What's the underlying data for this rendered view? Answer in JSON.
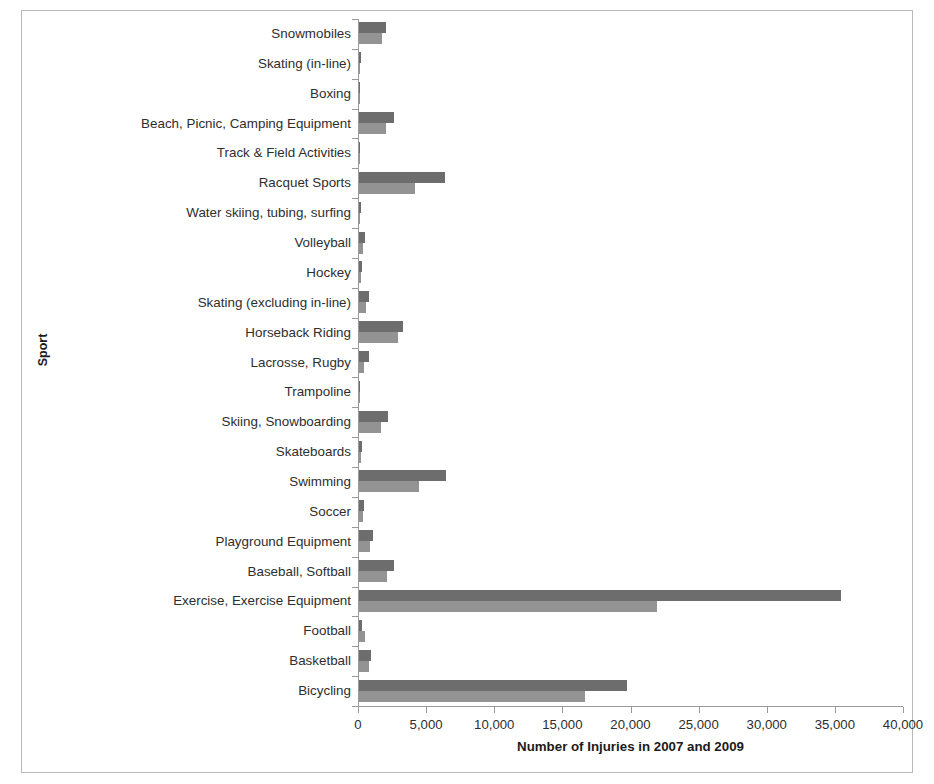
{
  "chart_data": {
    "type": "bar",
    "orientation": "horizontal",
    "title": "",
    "xlabel": "Number of Injuries in 2007 and 2009",
    "ylabel": "Sport",
    "xlim": [
      0,
      40000
    ],
    "xticks": [
      0,
      5000,
      10000,
      15000,
      20000,
      25000,
      30000,
      35000,
      40000
    ],
    "xtick_labels": [
      "0",
      "5,000",
      "10,000",
      "15,000",
      "20,000",
      "25,000",
      "30,000",
      "35,000",
      "40,000"
    ],
    "grid": false,
    "legend": "none",
    "categories": [
      "Snowmobiles",
      "Skating (in-line)",
      "Boxing",
      "Beach, Picnic, Camping Equipment",
      "Track & Field Activities",
      "Racquet Sports",
      "Water skiing, tubing, surfing",
      "Volleyball",
      "Hockey",
      "Skating (excluding in-line)",
      "Horseback Riding",
      "Lacrosse, Rugby",
      "Trampoline",
      "Skiing, Snowboarding",
      "Skateboards",
      "Swimming",
      "Soccer",
      "Playground Equipment",
      "Baseball, Softball",
      "Exercise, Exercise Equipment",
      "Football",
      "Basketball",
      "Bicycling"
    ],
    "series": [
      {
        "name": "2007",
        "color": "#6d6d6d",
        "values": [
          2000,
          150,
          60,
          2600,
          100,
          6300,
          150,
          450,
          250,
          750,
          3200,
          750,
          100,
          2100,
          250,
          6400,
          400,
          1000,
          2600,
          35400,
          250,
          850,
          19700
        ]
      },
      {
        "name": "2009",
        "color": "#939393",
        "values": [
          1700,
          100,
          50,
          2000,
          80,
          4100,
          100,
          300,
          150,
          500,
          2850,
          350,
          80,
          1650,
          150,
          4400,
          300,
          800,
          2050,
          21900,
          450,
          700,
          16600
        ]
      }
    ]
  },
  "axis": {
    "x_title": "Number of Injuries in 2007 and 2009",
    "y_title": "Sport"
  }
}
